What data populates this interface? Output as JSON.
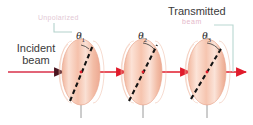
{
  "figure": {
    "background_color": "#ffffff",
    "width": 253,
    "height": 125
  },
  "labels": {
    "incident": "Incident\nbeam",
    "incident_line1": "Incident",
    "incident_line2": "beam",
    "transmitted": "Transmitted",
    "transmitted_beam_faded": "beam",
    "unpolarized_faded": "Unpolarized",
    "theta1": "θ",
    "theta1_sub": "1",
    "theta2": "θ",
    "theta2_sub": "2",
    "theta3": "θ",
    "theta3_sub": "3"
  },
  "colors": {
    "disk_fill": "#f6c3ae",
    "disk_fill_light": "#fbdfd2",
    "disk_edge": "#e8a088",
    "beam_red": "#e01b2b",
    "arrow_dark": "#4a1520",
    "axis_line": "#8c8c8c",
    "leader_line": "#b9d4ce",
    "dashed_axis": "#111111",
    "text": "#3a3a3a",
    "faded_text": "#dcb0c4"
  },
  "polarizers": [
    {
      "id": "polarizer-1",
      "cx": 81,
      "cy": 72,
      "rx": 19,
      "ry": 33,
      "axis_angle_deg": 20,
      "theta_label": "θ1"
    },
    {
      "id": "polarizer-2",
      "cx": 143,
      "cy": 72,
      "rx": 19,
      "ry": 33,
      "axis_angle_deg": 32,
      "theta_label": "θ2"
    },
    {
      "id": "polarizer-3",
      "cx": 207,
      "cy": 72,
      "rx": 19,
      "ry": 33,
      "axis_angle_deg": 40,
      "theta_label": "θ3"
    }
  ],
  "beam_segments": [
    {
      "id": "beam-incident",
      "x1": 8,
      "y1": 72,
      "x2": 62,
      "y2": 72
    },
    {
      "id": "beam-between-1-2",
      "x1": 88,
      "y1": 72,
      "x2": 124,
      "y2": 72
    },
    {
      "id": "beam-between-2-3",
      "x1": 150,
      "y1": 72,
      "x2": 188,
      "y2": 72
    },
    {
      "id": "beam-transmitted",
      "x1": 214,
      "y1": 72,
      "x2": 245,
      "y2": 72
    }
  ],
  "leaders": {
    "left_bracket": "vertical-then-horizontal connector from faded label to first polarizer",
    "right_bracket": "vertical connector from Transmitted label down to output ray"
  }
}
